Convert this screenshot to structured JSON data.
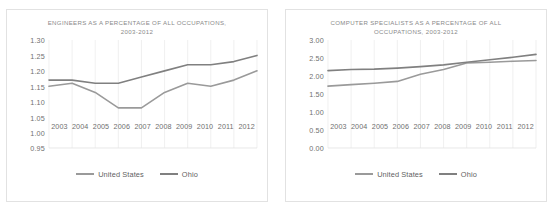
{
  "page": {
    "background_color": "#ffffff",
    "panel_border_color": "#e2e2e2"
  },
  "charts": [
    {
      "id": "engineers-chart",
      "title_line1": "ENGINEERS  AS A PERCENTAGE  OF ALL OCCUPATIONS,",
      "title_line2": "2003-2012",
      "legend": [
        {
          "label": "United States",
          "color": "#9a9a9a"
        },
        {
          "label": "Ohio",
          "color": "#808080"
        }
      ],
      "chart_data": {
        "type": "line",
        "title": "ENGINEERS AS A PERCENTAGE OF ALL OCCUPATIONS, 2003-2012",
        "xlabel": "",
        "ylabel": "",
        "x": [
          2003,
          2004,
          2005,
          2006,
          2007,
          2008,
          2009,
          2010,
          2011,
          2012
        ],
        "categories": [
          "2003",
          "2004",
          "2005",
          "2006",
          "2007",
          "2008",
          "2009",
          "2010",
          "2011",
          "2012"
        ],
        "yticks": [
          "0.95",
          "1.00",
          "1.05",
          "1.10",
          "1.15",
          "1.20",
          "1.25",
          "1.30"
        ],
        "ytick_values": [
          0.95,
          1.0,
          1.05,
          1.1,
          1.15,
          1.2,
          1.25,
          1.3
        ],
        "ylim": [
          0.95,
          1.3
        ],
        "grid": "vertical",
        "legend_position": "bottom",
        "series": [
          {
            "name": "United States",
            "color": "#9a9a9a",
            "values": [
              1.15,
              1.16,
              1.13,
              1.08,
              1.08,
              1.13,
              1.16,
              1.15,
              1.17,
              1.2
            ]
          },
          {
            "name": "Ohio",
            "color": "#808080",
            "values": [
              1.17,
              1.17,
              1.16,
              1.16,
              1.18,
              1.2,
              1.22,
              1.22,
              1.23,
              1.25
            ]
          }
        ]
      }
    },
    {
      "id": "computer-specialists-chart",
      "title_line1": "COMPUTER SPECIALISTS  AS A PERCENTAGE  OF ALL",
      "title_line2": "OCCUPATIONS,  2003-2012",
      "legend": [
        {
          "label": "United States",
          "color": "#9a9a9a"
        },
        {
          "label": "Ohio",
          "color": "#808080"
        }
      ],
      "chart_data": {
        "type": "line",
        "title": "COMPUTER SPECIALISTS AS A PERCENTAGE OF ALL OCCUPATIONS, 2003-2012",
        "xlabel": "",
        "ylabel": "",
        "x": [
          2003,
          2004,
          2005,
          2006,
          2007,
          2008,
          2009,
          2010,
          2011,
          2012
        ],
        "categories": [
          "2003",
          "2004",
          "2005",
          "2006",
          "2007",
          "2008",
          "2009",
          "2010",
          "2011",
          "2012"
        ],
        "yticks": [
          "0.00",
          "0.50",
          "1.00",
          "1.50",
          "2.00",
          "2.50",
          "3.00"
        ],
        "ytick_values": [
          0.0,
          0.5,
          1.0,
          1.5,
          2.0,
          2.5,
          3.0
        ],
        "ylim": [
          0.0,
          3.0
        ],
        "grid": "vertical",
        "legend_position": "bottom",
        "series": [
          {
            "name": "United States",
            "color": "#9a9a9a",
            "values": [
              1.72,
              1.76,
              1.8,
              1.85,
              2.05,
              2.18,
              2.36,
              2.38,
              2.41,
              2.43
            ]
          },
          {
            "name": "Ohio",
            "color": "#808080",
            "values": [
              2.15,
              2.18,
              2.19,
              2.22,
              2.26,
              2.31,
              2.38,
              2.45,
              2.52,
              2.6
            ]
          }
        ]
      }
    }
  ]
}
